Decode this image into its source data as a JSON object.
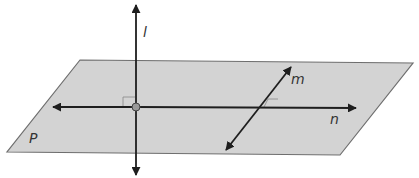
{
  "diagram": {
    "plane_label": "P",
    "line_labels": {
      "vertical": "l",
      "oblique": "m",
      "horizontal": "n"
    },
    "colors": {
      "plane_fill": "#d3d3d3",
      "plane_stroke": "#6e6e6e",
      "lines": "#1e1e1e"
    }
  }
}
